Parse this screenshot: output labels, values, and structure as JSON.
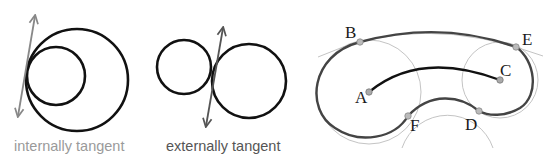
{
  "diagrams": {
    "internal": {
      "caption": "internally tangent",
      "caption_color": "#9a9a9a",
      "large_circle": {
        "cx": 77,
        "cy": 80,
        "r": 51
      },
      "small_circle": {
        "cx": 56,
        "cy": 76,
        "r": 29
      },
      "tangent_arrow": {
        "x1": 18,
        "y1": 124,
        "x2": 37,
        "y2": 12,
        "color": "#888888"
      }
    },
    "external": {
      "caption": "externally tangent",
      "caption_color": "#555555",
      "left_circle": {
        "cx": 184,
        "cy": 67,
        "r": 27
      },
      "right_circle": {
        "cx": 249,
        "cy": 81,
        "r": 37
      },
      "tangent_arrow": {
        "x1": 205,
        "y1": 131,
        "x2": 224,
        "y2": 24,
        "color": "#555555"
      }
    },
    "curve": {
      "points": [
        {
          "label": "A",
          "x": 369,
          "y": 92
        },
        {
          "label": "B",
          "x": 360,
          "y": 42
        },
        {
          "label": "C",
          "x": 500,
          "y": 80
        },
        {
          "label": "D",
          "x": 479,
          "y": 111
        },
        {
          "label": "E",
          "x": 516,
          "y": 47
        },
        {
          "label": "F",
          "x": 408,
          "y": 116
        }
      ],
      "stroke_color": "#444444",
      "guide_color": "#b8b8b8",
      "point_color": "#aaaaaa"
    }
  }
}
